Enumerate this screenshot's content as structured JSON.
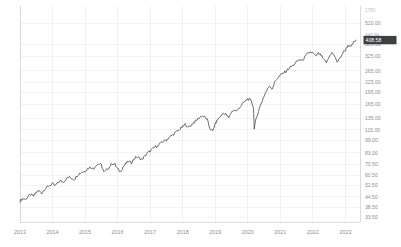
{
  "chart_data": {
    "type": "line",
    "title": "",
    "xlabel": "",
    "ylabel": "",
    "scale": "logarithmic",
    "grid": true,
    "legend": false,
    "axis_position": "right",
    "line_color": "#4f5257",
    "x_tick_labels": [
      "2013",
      "2014",
      "2015",
      "2016",
      "2017",
      "2018",
      "2019",
      "2020",
      "2021",
      "2022",
      "2023"
    ],
    "y_tick_labels": [
      "1750",
      "520.00",
      "440.94",
      "385.00",
      "325.00",
      "265.00",
      "225.00",
      "195.00",
      "165.00",
      "135.00",
      "115.00",
      "99.00",
      "83.00",
      "70.50",
      "60.50",
      "52.50",
      "44.50",
      "38.50",
      "33.50"
    ],
    "current_price_badge": "408.58",
    "high_label": "440.94",
    "top_label": "1750",
    "ylim": [
      33.5,
      1750
    ],
    "x": [
      2013.0,
      2013.08,
      2013.17,
      2013.25,
      2013.33,
      2013.42,
      2013.5,
      2013.58,
      2013.67,
      2013.75,
      2013.83,
      2013.92,
      2014.0,
      2014.08,
      2014.17,
      2014.25,
      2014.33,
      2014.42,
      2014.5,
      2014.58,
      2014.67,
      2014.75,
      2014.83,
      2014.92,
      2015.0,
      2015.08,
      2015.17,
      2015.25,
      2015.33,
      2015.42,
      2015.5,
      2015.58,
      2015.67,
      2015.75,
      2015.83,
      2015.92,
      2016.0,
      2016.08,
      2016.17,
      2016.25,
      2016.33,
      2016.42,
      2016.5,
      2016.58,
      2016.67,
      2016.75,
      2016.83,
      2016.92,
      2017.0,
      2017.08,
      2017.17,
      2017.25,
      2017.33,
      2017.42,
      2017.5,
      2017.58,
      2017.67,
      2017.75,
      2017.83,
      2017.92,
      2018.0,
      2018.08,
      2018.17,
      2018.25,
      2018.33,
      2018.42,
      2018.5,
      2018.58,
      2018.67,
      2018.75,
      2018.83,
      2018.92,
      2019.0,
      2019.08,
      2019.17,
      2019.25,
      2019.33,
      2019.42,
      2019.5,
      2019.58,
      2019.67,
      2019.75,
      2019.83,
      2019.92,
      2020.0,
      2020.08,
      2020.17,
      2020.2,
      2020.25,
      2020.33,
      2020.42,
      2020.5,
      2020.58,
      2020.67,
      2020.75,
      2020.83,
      2020.92,
      2021.0,
      2021.08,
      2021.17,
      2021.25,
      2021.33,
      2021.42,
      2021.5,
      2021.58,
      2021.67,
      2021.75,
      2021.83,
      2021.92,
      2022.0,
      2022.08,
      2022.17,
      2022.25,
      2022.33,
      2022.42,
      2022.5,
      2022.58,
      2022.67,
      2022.75,
      2022.83,
      2022.92,
      2023.0,
      2023.08,
      2023.17,
      2023.25,
      2023.33
    ],
    "values": [
      42.0,
      43.5,
      43.0,
      44.8,
      46.0,
      45.0,
      47.5,
      48.5,
      47.0,
      49.5,
      51.0,
      52.5,
      53.5,
      52.0,
      54.5,
      56.0,
      55.0,
      57.5,
      59.0,
      58.0,
      57.0,
      60.0,
      62.0,
      63.5,
      64.0,
      66.5,
      68.0,
      66.0,
      69.5,
      71.0,
      70.0,
      63.0,
      65.5,
      68.0,
      71.5,
      70.5,
      66.0,
      63.5,
      68.0,
      71.0,
      73.5,
      72.0,
      76.0,
      78.5,
      77.0,
      75.5,
      79.0,
      83.0,
      85.0,
      88.0,
      90.5,
      92.0,
      95.5,
      98.0,
      99.5,
      103.0,
      106.0,
      109.0,
      113.0,
      116.0,
      120.0,
      124.0,
      119.0,
      122.0,
      127.0,
      131.0,
      136.0,
      140.0,
      138.0,
      133.0,
      118.0,
      112.0,
      125.0,
      133.0,
      140.0,
      145.0,
      143.0,
      136.0,
      148.0,
      152.0,
      150.0,
      158.0,
      165.0,
      172.0,
      178.0,
      175.0,
      160.0,
      118.0,
      132.0,
      150.0,
      168.0,
      185.0,
      200.0,
      215.0,
      205.0,
      225.0,
      240.0,
      248.0,
      255.0,
      262.0,
      272.0,
      280.0,
      288.0,
      300.0,
      310.0,
      305.0,
      320.0,
      335.0,
      345.0,
      340.0,
      325.0,
      338.0,
      330.0,
      310.0,
      298.0,
      320.0,
      345.0,
      325.0,
      300.0,
      315.0,
      340.0,
      355.0,
      380.0,
      370.0,
      395.0,
      408.58
    ]
  }
}
